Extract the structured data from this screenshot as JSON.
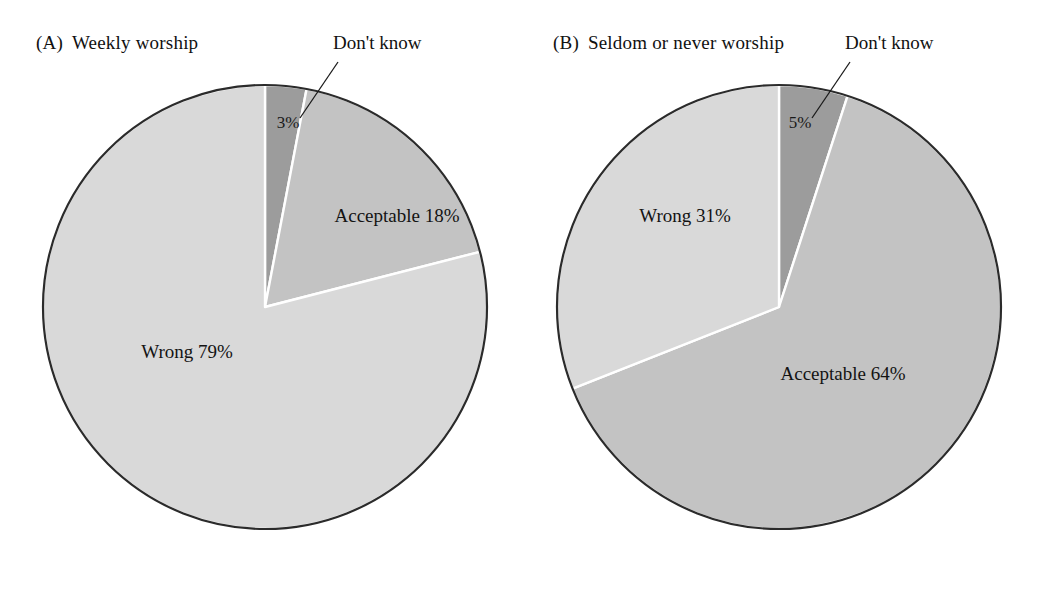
{
  "figure": {
    "background": "#ffffff",
    "panels": [
      {
        "tag": "(A)",
        "title": "Weekly worship",
        "callout_label": "Don't know",
        "center": {
          "x": 265,
          "y": 307
        },
        "radius": 222
      },
      {
        "tag": "(B)",
        "title": "Seldom or never worship",
        "callout_label": "Don't know",
        "center": {
          "x": 779,
          "y": 307
        },
        "radius": 222
      }
    ]
  },
  "chart_data": [
    {
      "type": "pie",
      "title": "(A) Weekly worship",
      "panel_tag": "(A)",
      "panel_title": "Weekly worship",
      "categories": [
        "Don't know",
        "Acceptable",
        "Wrong"
      ],
      "values": [
        3,
        18,
        79
      ],
      "unit": "%",
      "start_angle_deg": 0,
      "direction": "clockwise",
      "slice_colors": [
        "#9c9c9c",
        "#c3c3c3",
        "#d9d9d9"
      ],
      "slice_label_texts": [
        "3%",
        "Acceptable 18%",
        "Wrong 79%"
      ],
      "callout": {
        "label": "Don't know",
        "points_to": "Don't know",
        "value": "3%"
      },
      "legend": "none",
      "grid": false
    },
    {
      "type": "pie",
      "title": "(B) Seldom or never worship",
      "panel_tag": "(B)",
      "panel_title": "Seldom or never worship",
      "categories": [
        "Don't know",
        "Acceptable",
        "Wrong"
      ],
      "values": [
        5,
        64,
        31
      ],
      "unit": "%",
      "start_angle_deg": 0,
      "direction": "clockwise",
      "slice_colors": [
        "#9c9c9c",
        "#c3c3c3",
        "#d9d9d9"
      ],
      "slice_label_texts": [
        "5%",
        "Acceptable 64%",
        "Wrong 31%"
      ],
      "callout": {
        "label": "Don't know",
        "points_to": "Don't know",
        "value": "5%"
      },
      "legend": "none",
      "grid": false
    }
  ],
  "labels": {
    "a": {
      "dont_know": "Don't know",
      "pct_dont_know": "3%",
      "acceptable": "Acceptable 18%",
      "wrong": "Wrong 79%"
    },
    "b": {
      "dont_know": "Don't know",
      "pct_dont_know": "5%",
      "acceptable": "Acceptable 64%",
      "wrong": "Wrong 31%"
    }
  },
  "colors": {
    "slice_wrong": "#d9d9d9",
    "slice_acceptable": "#c3c3c3",
    "slice_dont_know": "#9c9c9c",
    "outline": "#2b2b2b",
    "separator": "#ffffff",
    "text": "#111111"
  }
}
